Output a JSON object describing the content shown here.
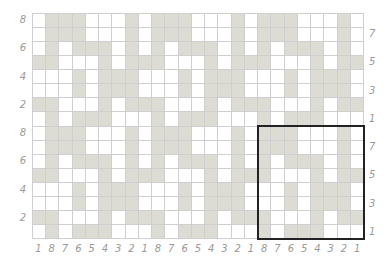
{
  "puzzle": {
    "columns": 25,
    "rows": 16,
    "colors": {
      "shaded": "#dcdcd4",
      "empty": "#ffffff",
      "grid_line": "#cfcfcf",
      "highlight_border": "#222222",
      "label": "#9a9a9a"
    },
    "tile_pattern_note": "8x8 tile repeating across columns 1-24; column 0 equals column 8",
    "grid": [
      "0111000101110001011100010",
      "0111000101110001011100010",
      "0101110101011101010111010",
      "1100010111000101110001011",
      "0001011100010111000101110",
      "0001011100010111000101110",
      "1100010111000101110001011",
      "0101110001011100010111000",
      "0111000101110001011100010",
      "0111000101110001011100010",
      "0101110101011101010111010",
      "1100010111000101110001011",
      "0001011100010111000101110",
      "0001011100010111000101110",
      "1100010111000101110001011",
      "0101110001011100010111000"
    ],
    "highlight_box": {
      "col_start": 17,
      "col_end": 24,
      "row_start": 8,
      "row_end": 15
    }
  },
  "labels": {
    "left": [
      {
        "row": 0,
        "text": "8"
      },
      {
        "row": 2,
        "text": "6"
      },
      {
        "row": 4,
        "text": "4"
      },
      {
        "row": 6,
        "text": "2"
      },
      {
        "row": 8,
        "text": "8"
      },
      {
        "row": 10,
        "text": "6"
      },
      {
        "row": 12,
        "text": "4"
      },
      {
        "row": 14,
        "text": "2"
      }
    ],
    "right": [
      {
        "row": 1,
        "text": "7"
      },
      {
        "row": 3,
        "text": "5"
      },
      {
        "row": 5,
        "text": "3"
      },
      {
        "row": 7,
        "text": "1"
      },
      {
        "row": 9,
        "text": "7"
      },
      {
        "row": 11,
        "text": "5"
      },
      {
        "row": 13,
        "text": "3"
      },
      {
        "row": 15,
        "text": "1"
      }
    ],
    "bottom": [
      "1",
      "8",
      "7",
      "6",
      "5",
      "4",
      "3",
      "2",
      "1",
      "8",
      "7",
      "6",
      "5",
      "4",
      "3",
      "2",
      "1",
      "8",
      "7",
      "6",
      "5",
      "4",
      "3",
      "2",
      "1"
    ]
  }
}
